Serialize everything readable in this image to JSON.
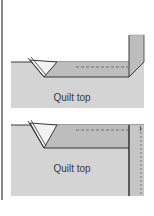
{
  "diagram": {
    "type": "quilt-binding-steps",
    "panels": [
      {
        "id": "step-1",
        "label": "Quilt top"
      },
      {
        "id": "step-2",
        "label": "Quilt top"
      }
    ],
    "colors": {
      "quilt_fill": "#d4d4d4",
      "binding_fill": "#bdbdbd",
      "outline": "#3a3a3a",
      "fold_fill": "#f2f2f2",
      "background": "#ffffff"
    }
  }
}
